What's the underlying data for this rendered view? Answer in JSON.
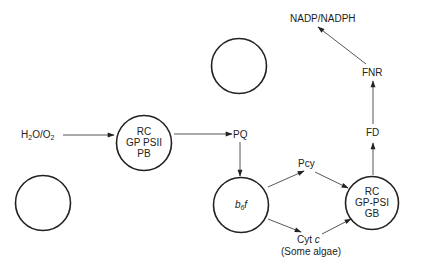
{
  "diagram": {
    "nodes": {
      "psii": {
        "line1": "RC",
        "line2": "GP PSII",
        "line3": "PB"
      },
      "b6f": {
        "main": "b",
        "sub": "6",
        "suffix": "f"
      },
      "psi": {
        "line1": "RC",
        "line2": "GP-PSI",
        "line3": "GB"
      },
      "empty_top": "",
      "empty_left": ""
    },
    "labels": {
      "water_main": "H",
      "water_sub1": "2",
      "water_mid": "O/O",
      "water_sub2": "2",
      "pq": "PQ",
      "pcy": "Pcy",
      "cytc_main": "Cyt",
      "cytc_italic": "c",
      "cytc_note": "(Some algae)",
      "fd": "FD",
      "fnr": "FNR",
      "nadp": "NADP/NADPH"
    },
    "edges": [
      {
        "from": "H2O/O2",
        "to": "PSII"
      },
      {
        "from": "PSII",
        "to": "PQ"
      },
      {
        "from": "PQ",
        "to": "b6f"
      },
      {
        "from": "b6f",
        "to": "Pcy"
      },
      {
        "from": "b6f",
        "to": "Cyt c"
      },
      {
        "from": "Pcy",
        "to": "PSI"
      },
      {
        "from": "Cyt c",
        "to": "PSI"
      },
      {
        "from": "PSI",
        "to": "FD"
      },
      {
        "from": "FD",
        "to": "FNR"
      },
      {
        "from": "FNR",
        "to": "NADP/NADPH"
      }
    ],
    "colors": {
      "stroke": "#222222",
      "text": "#222222",
      "background": "#ffffff"
    }
  }
}
